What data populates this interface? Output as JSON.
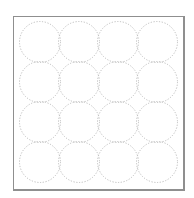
{
  "diagram": {
    "type": "circle-grid",
    "rows": 4,
    "cols": 4,
    "circle_style": "dotted",
    "colors": {
      "circle_stroke": "#bdbdbd",
      "frame_border": "#8f8f8f",
      "background": "#ffffff"
    },
    "frame": {
      "x": 13,
      "y": 16,
      "width": 171,
      "height": 174
    },
    "circles": {
      "diameter": 41,
      "center_x": [
        40,
        79,
        118,
        157
      ],
      "center_y": [
        42,
        82,
        122,
        162
      ]
    }
  }
}
